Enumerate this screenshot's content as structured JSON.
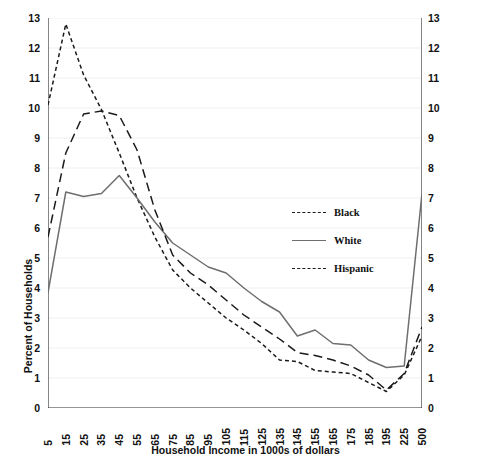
{
  "chart_data": {
    "type": "line",
    "title": "",
    "xlabel": "Household Income in 1000s of dollars",
    "ylabel": "Percent of Households",
    "ylim": [
      0,
      13
    ],
    "ytick_step": 1,
    "yminor_step": 0.5,
    "grid": true,
    "grid_axis": "y",
    "dual_y_axis": true,
    "legend_position": "center-right inside plot",
    "categories": [
      "5",
      "15",
      "25",
      "35",
      "45",
      "55",
      "65",
      "75",
      "85",
      "95",
      "105",
      "115",
      "125",
      "135",
      "145",
      "155",
      "165",
      "175",
      "185",
      "195",
      "225",
      "500"
    ],
    "yticks": [
      "0",
      "1",
      "2",
      "3",
      "4",
      "5",
      "6",
      "7",
      "8",
      "9",
      "10",
      "11",
      "12",
      "13"
    ],
    "series": [
      {
        "name": "Black",
        "style": "short-dash",
        "color": "#1a1a1a",
        "values": [
          10.1,
          12.8,
          11.1,
          9.95,
          8.5,
          7.0,
          5.7,
          4.6,
          4.0,
          3.5,
          3.0,
          2.6,
          2.15,
          1.6,
          1.55,
          1.25,
          1.2,
          1.15,
          0.85,
          0.55,
          1.1,
          2.4
        ]
      },
      {
        "name": "White",
        "style": "solid",
        "color": "#6e6e6e",
        "values": [
          3.85,
          7.2,
          7.05,
          7.15,
          7.75,
          7.0,
          6.2,
          5.5,
          5.1,
          4.7,
          4.5,
          4.0,
          3.55,
          3.2,
          2.4,
          2.6,
          2.15,
          2.1,
          1.6,
          1.35,
          1.4,
          7.15
        ]
      },
      {
        "name": "Hispanic",
        "style": "long-dash",
        "color": "#1a1a1a",
        "values": [
          5.7,
          8.5,
          9.8,
          9.9,
          9.75,
          8.6,
          6.6,
          5.1,
          4.5,
          4.1,
          3.6,
          3.1,
          2.7,
          2.3,
          1.85,
          1.75,
          1.6,
          1.4,
          1.1,
          0.6,
          1.15,
          2.7
        ]
      }
    ]
  },
  "axes": {
    "x_title": "Household Income in 1000s of dollars",
    "y_title": "Percent of Households"
  },
  "legend": {
    "items": [
      {
        "label": "Black"
      },
      {
        "label": "White"
      },
      {
        "label": "Hispanic"
      }
    ]
  }
}
